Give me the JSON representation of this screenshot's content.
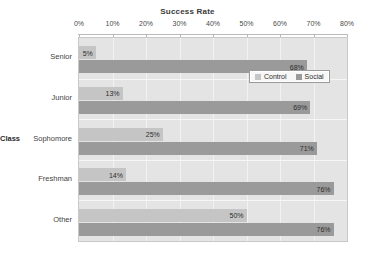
{
  "chart_data": {
    "type": "bar",
    "orientation": "horizontal",
    "title": "Success Rate",
    "xlabel": "",
    "ylabel": "Class",
    "categories": [
      "Senior",
      "Junior",
      "Sophomore",
      "Freshman",
      "Other"
    ],
    "series": [
      {
        "name": "Control",
        "color": "#c5c5c5",
        "values": [
          5,
          13,
          25,
          14,
          50
        ]
      },
      {
        "name": "Social",
        "color": "#9a9a9a",
        "values": [
          68,
          69,
          71,
          76,
          76
        ]
      }
    ],
    "value_labels": {
      "Control": [
        "5%",
        "13%",
        "25%",
        "14%",
        "50%"
      ],
      "Social": [
        "68%",
        "69%",
        "71%",
        "76%",
        "76%"
      ]
    },
    "xlim": [
      0,
      80
    ],
    "xticks": [
      0,
      10,
      20,
      30,
      40,
      50,
      60,
      70,
      80
    ],
    "xtick_labels": [
      "0%",
      "10%",
      "20%",
      "30%",
      "40%",
      "50%",
      "60%",
      "70%",
      "80%"
    ],
    "grid": true,
    "legend_position": "upper right inside",
    "plot_background": "#e4e4e4"
  },
  "legend": {
    "items": [
      {
        "label": "Control",
        "color": "#c5c5c5"
      },
      {
        "label": "Social",
        "color": "#9a9a9a"
      }
    ]
  }
}
